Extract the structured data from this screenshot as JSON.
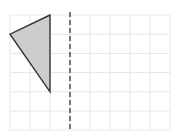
{
  "diagram": {
    "type": "grid-reflection",
    "grid": {
      "origin_px": [
        10,
        15
      ],
      "cols": 8,
      "rows": 6,
      "cell_w": 20,
      "cell_h": 19.2,
      "line_color": "#e6e6e6",
      "border_color": "#e9e9e9"
    },
    "shape": {
      "kind": "triangle",
      "vertices_grid": [
        [
          2,
          0
        ],
        [
          0,
          1
        ],
        [
          2,
          4
        ]
      ],
      "fill": "#cccccc",
      "stroke": "#333333"
    },
    "mirror_line": {
      "orientation": "vertical",
      "x_grid": 3,
      "style": "dashed",
      "color": "#333333"
    }
  }
}
